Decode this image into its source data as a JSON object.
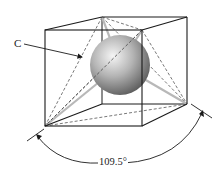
{
  "figure": {
    "labels": {
      "atom": "C",
      "angle": "109.5°"
    },
    "colors": {
      "line": "#1a1a1a",
      "dashed": "#555555",
      "bond": "#bdbdbd",
      "sphere_light": "#f2f2f2",
      "sphere_dark": "#5a5a5a"
    }
  }
}
